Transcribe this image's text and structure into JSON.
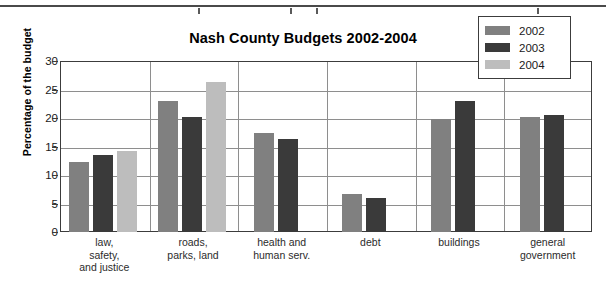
{
  "chart_data": {
    "type": "bar",
    "title": "Nash County Budgets 2002-2004",
    "xlabel": "",
    "ylabel": "Percentage of the budget",
    "ylim": [
      0,
      30
    ],
    "yticks": [
      0,
      5,
      10,
      15,
      20,
      25,
      30
    ],
    "grid": true,
    "legend_position": "top-right",
    "categories": [
      "law,\nsafety,\nand justice",
      "roads,\nparks, land",
      "health and\nhuman serv.",
      "debt",
      "buildings",
      "general\ngovernment"
    ],
    "category_lines": [
      [
        "law,",
        "safety,",
        "and justice"
      ],
      [
        "roads,",
        "parks, land"
      ],
      [
        "health and",
        "human serv."
      ],
      [
        "debt"
      ],
      [
        "buildings"
      ],
      [
        "general",
        "government"
      ]
    ],
    "series": [
      {
        "name": "2002",
        "color": "#808080",
        "values": [
          12.2,
          22.9,
          17.4,
          6.7,
          19.9,
          20.1
        ]
      },
      {
        "name": "2003",
        "color": "#3a3a3a",
        "values": [
          13.5,
          20.1,
          16.3,
          6.0,
          22.9,
          20.5
        ]
      },
      {
        "name": "2004",
        "color": "#bdbdbd",
        "values": [
          14.2,
          26.3,
          null,
          null,
          null,
          null
        ]
      }
    ]
  },
  "legend": {
    "entries": [
      {
        "label": "2002",
        "color": "#808080"
      },
      {
        "label": "2003",
        "color": "#3a3a3a"
      },
      {
        "label": "2004",
        "color": "#bdbdbd"
      }
    ]
  },
  "axis": {
    "y_tick_labels": [
      "30",
      "25",
      "20",
      "15",
      "10",
      "5",
      "0"
    ]
  }
}
